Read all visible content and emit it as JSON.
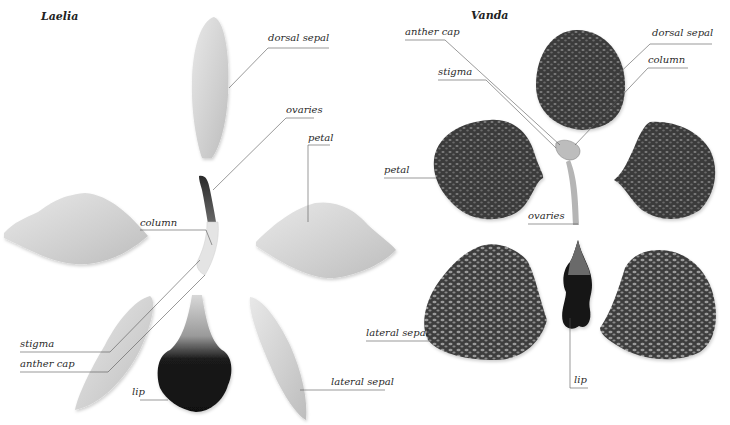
{
  "diagram": {
    "panels": [
      {
        "id": "laelia",
        "title": "Laelia",
        "labels": {
          "dorsal_sepal": "dorsal sepal",
          "ovaries": "ovaries",
          "petal": "petal",
          "column": "column",
          "stigma": "stigma",
          "anther_cap": "anther cap",
          "lip": "lip",
          "lateral_sepal": "lateral sepal"
        }
      },
      {
        "id": "vanda",
        "title": "Vanda",
        "labels": {
          "anther_cap": "anther cap",
          "dorsal_sepal": "dorsal sepal",
          "column": "column",
          "stigma": "stigma",
          "petal": "petal",
          "ovaries": "ovaries",
          "lateral_sepal": "lateral sepal",
          "lip": "lip"
        }
      }
    ],
    "colors": {
      "background": "#ffffff",
      "laelia_petal": "#d9d9d9",
      "laelia_lip": "#151515",
      "vanda_part": "#3c3c3c",
      "leader_line": "#555555"
    }
  }
}
